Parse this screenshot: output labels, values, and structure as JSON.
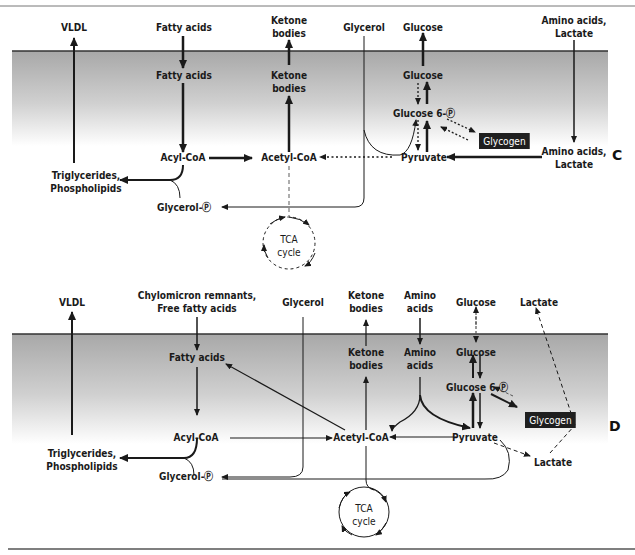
{
  "figure": {
    "top_rule_y": 6,
    "bottom_rule_y": 549,
    "colors": {
      "cell_shade_top": "#a9a9a9",
      "cell_shade_bottom": "#ffffff",
      "membrane": "#333333",
      "arrow": "#1a1a1a",
      "glycogen_box": "#1f1f1f",
      "glycogen_text": "#ffffff"
    }
  },
  "panel_c": {
    "letter": "C",
    "outside_labels": {
      "vldl": "VLDL",
      "fatty_acids": "Fatty acids",
      "ketone_bodies": "Ketone\nbodies",
      "glycerol": "Glycerol",
      "glucose": "Glucose",
      "amino_acids_lactate": "Amino acids,\nLactate"
    },
    "inside_labels": {
      "fatty_acids": "Fatty acids",
      "ketone_bodies": "Ketone\nbodies",
      "glucose": "Glucose",
      "glucose_6p": "Glucose 6-Ⓟ",
      "glycogen": "Glycogen",
      "acyl_coa": "Acyl-CoA",
      "acetyl_coa": "Acetyl-CoA",
      "pyruvate": "Pyruvate",
      "amino_acids_lactate": "Amino acids,\nLactate",
      "triglycerides": "Triglycerides,\nPhospholipids",
      "glycerol_p": "Glycerol-Ⓟ",
      "tca_cycle": "TCA\ncycle"
    }
  },
  "panel_d": {
    "letter": "D",
    "outside_labels": {
      "vldl": "VLDL",
      "chylomicron": "Chylomicron remnants,\nFree fatty acids",
      "glycerol": "Glycerol",
      "ketone_bodies": "Ketone\nbodies",
      "amino_acids": "Amino\nacids",
      "glucose": "Glucose",
      "lactate": "Lactate"
    },
    "inside_labels": {
      "fatty_acids": "Fatty acids",
      "ketone_bodies": "Ketone\nbodies",
      "amino_acids": "Amino\nacids",
      "glucose": "Glucose",
      "glucose_6p": "Glucose 6-Ⓟ",
      "glycogen": "Glycogen",
      "acyl_coa": "Acyl-CoA",
      "acetyl_coa": "Acetyl-CoA",
      "pyruvate": "Pyruvate",
      "lactate": "Lactate",
      "triglycerides": "Triglycerides,\nPhospholipids",
      "glycerol_p": "Glycerol-Ⓟ",
      "tca_cycle": "TCA\ncycle"
    }
  }
}
